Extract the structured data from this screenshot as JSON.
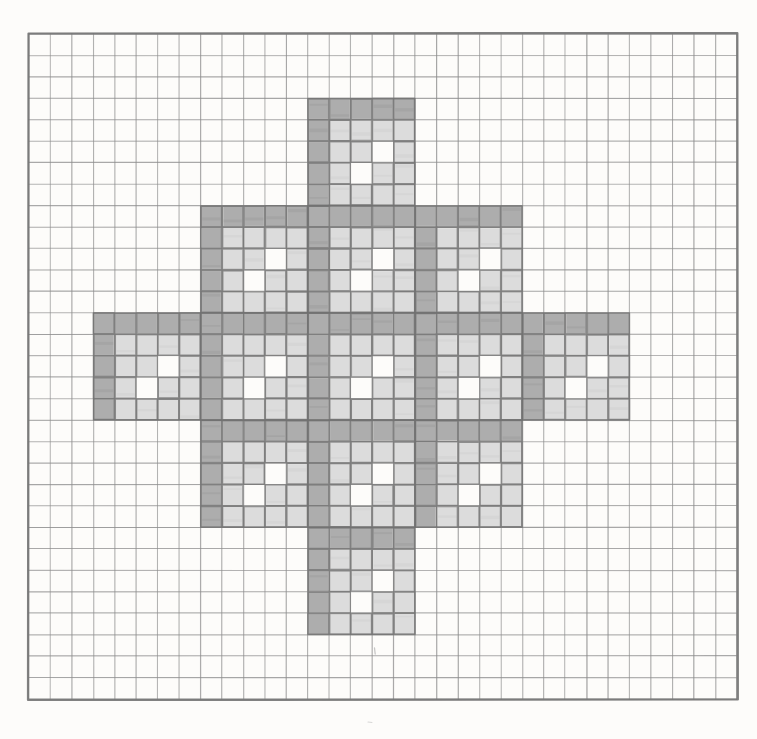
{
  "page": {
    "medium": "pencil on square-ruled graph paper",
    "background_color": "#fdfcfa"
  },
  "grid": {
    "label": "square-ruled graph paper",
    "origin_x": 29,
    "origin_y": 34,
    "cell_size": 21.45,
    "columns": 33,
    "rows": 31,
    "line_color": "#8d8d8d",
    "line_width": 1.0,
    "border_color": "#6f6f6f",
    "border_width": 2.2
  },
  "figure": {
    "name": "vicsek-fractal-cross",
    "iteration": 2,
    "base_shape": "plus",
    "block_cells": 5,
    "blocks_across": 5,
    "total_span_cells": 25,
    "origin_col": 3,
    "origin_row": 3,
    "filled_blocks": 13,
    "filled_cells": 169,
    "dark_color": "#a9a9a9",
    "light_color": "#d9d9d9",
    "white_color": "#ffffff",
    "outline_color": "#7a7a7a",
    "block_pattern": [
      [
        1,
        1,
        1,
        1,
        1
      ],
      [
        1,
        1,
        1,
        1,
        1
      ],
      [
        1,
        1,
        1,
        0,
        1
      ],
      [
        1,
        1,
        0,
        1,
        1
      ],
      [
        1,
        1,
        1,
        1,
        1
      ]
    ],
    "plus_layout": [
      [
        0,
        0,
        1,
        0,
        0
      ],
      [
        0,
        1,
        1,
        1,
        0
      ],
      [
        1,
        1,
        1,
        1,
        1
      ],
      [
        0,
        1,
        1,
        1,
        0
      ],
      [
        0,
        0,
        1,
        0,
        0
      ]
    ],
    "dark_cells_per_block": 9,
    "shade_note": "top row and left column of each block are drawn in darker pencil"
  },
  "annotations": {
    "stray_mark": "faint pencil tick below bottom arm",
    "stray_mark_color": "#b9b9b9"
  }
}
